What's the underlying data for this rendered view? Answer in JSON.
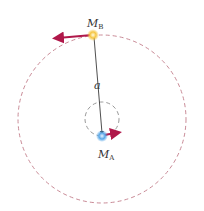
{
  "diagram": {
    "labels": {
      "mass_b": "M",
      "mass_b_sub": "B",
      "mass_a": "M",
      "mass_a_sub": "A",
      "separation": "a"
    },
    "colors": {
      "orbit": "#c98a96",
      "velocity_arrow": "#b0184a",
      "separation_line": "#222222",
      "star_b": "#f5c542",
      "star_a": "#5aa8e8"
    }
  }
}
